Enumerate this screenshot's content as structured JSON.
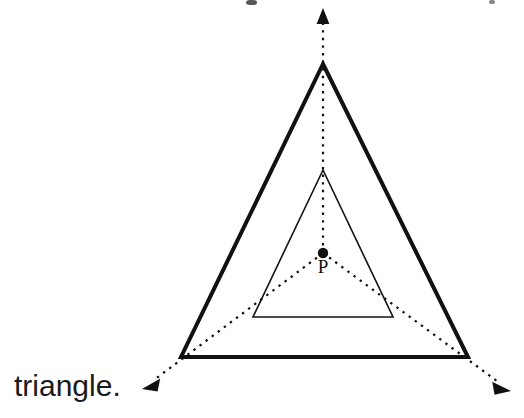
{
  "figure": {
    "background_color": "#ffffff",
    "ink_color": "#111111",
    "width": 524,
    "height": 418,
    "caption": {
      "text": "triangle.",
      "x": 14,
      "baseline_y": 396,
      "font_size": 30,
      "note": "clipped trailing fragment of a sentence from the page above"
    },
    "point": {
      "label": "P",
      "label_x": 323,
      "label_y": 273,
      "center_x": 323,
      "center_y": 253,
      "dot_radius": 5.2
    },
    "outer_triangle": {
      "name": "outer-triangle",
      "stroke_width": 4,
      "vertices": [
        {
          "name": "apex",
          "x": 323,
          "y": 64
        },
        {
          "name": "bottom-right",
          "x": 468,
          "y": 357
        },
        {
          "name": "bottom-left",
          "x": 181,
          "y": 357
        }
      ],
      "points": "323,64 468,357 181,357"
    },
    "inner_triangle": {
      "name": "inner-triangle",
      "stroke_width": 1.6,
      "vertices": [
        {
          "name": "apex",
          "x": 323,
          "y": 170
        },
        {
          "name": "bottom-right",
          "x": 393,
          "y": 317
        },
        {
          "name": "bottom-left",
          "x": 253,
          "y": 317
        }
      ],
      "points": "323,170 393,317 253,317"
    },
    "rays": [
      {
        "name": "ray-up",
        "direction": "up",
        "from_x": 323,
        "from_y": 253,
        "to_x": 323,
        "to_y": 20,
        "arrow_tip_x": 323,
        "arrow_tip_y": 8,
        "arrow_points": "323,8 316.6,24 329.4,24"
      },
      {
        "name": "ray-down-left",
        "direction": "down-left",
        "from_x": 323,
        "from_y": 253,
        "to_x": 154,
        "to_y": 380,
        "arrow_tip_x": 142,
        "arrow_tip_y": 389,
        "arrow_points": "142,389 160.2,378.5 157.6,391.6"
      },
      {
        "name": "ray-down-right",
        "direction": "down-right",
        "from_x": 323,
        "from_y": 253,
        "to_x": 497,
        "to_y": 381,
        "arrow_tip_x": 511,
        "arrow_tip_y": 391,
        "arrow_points": "511,391 492.2,381.8 494.6,394.8"
      }
    ],
    "clipped_glyphs": [
      {
        "name": "clipped-glyph-center",
        "x": 246,
        "y": 0,
        "w": 11,
        "h": 5,
        "rx": 5
      },
      {
        "name": "clipped-glyph-right",
        "x": 489,
        "y": 0,
        "w": 6,
        "h": 4,
        "rx": 2
      }
    ]
  }
}
